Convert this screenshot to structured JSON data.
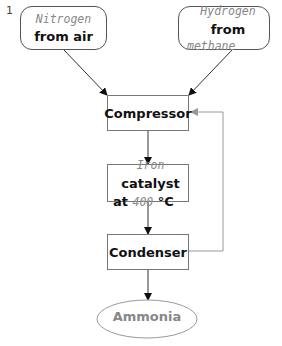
{
  "figure_number": "1",
  "nodes": {
    "nitrogen": {
      "line1_hand": "Nitrogen",
      "line2_bold": "from air"
    },
    "hydrogen": {
      "line1_hand": "Hydrogen",
      "line1_bold": " from",
      "line2_hand": "methane"
    },
    "compressor": {
      "label": "Compressor"
    },
    "catalyst": {
      "hand1": "Iron",
      "bold1": " catalyst",
      "bold2a": "at ",
      "hand2": "400",
      "bold2b": " °C"
    },
    "condenser": {
      "label": "Condenser"
    },
    "ammonia": {
      "label": "Ammonia"
    }
  },
  "edges": [
    {
      "from": "nitrogen",
      "to": "compressor"
    },
    {
      "from": "hydrogen",
      "to": "compressor"
    },
    {
      "from": "compressor",
      "to": "catalyst"
    },
    {
      "from": "catalyst",
      "to": "condenser"
    },
    {
      "from": "condenser",
      "to": "ammonia"
    },
    {
      "from": "condenser",
      "to": "compressor",
      "type": "recycle"
    }
  ],
  "colors": {
    "line": "#222222",
    "recycle_line": "#999999",
    "ammonia_text": "#888888"
  }
}
